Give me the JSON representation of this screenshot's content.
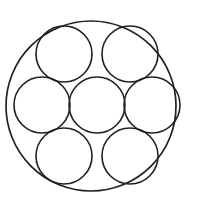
{
  "figure": {
    "name": "seven-circles-in-circle",
    "background_color": "#ffffff",
    "stroke_color": "#231f20",
    "stroke_width": 1.6,
    "fill": "none",
    "canvas": {
      "width": 202,
      "height": 201
    },
    "outer_circle": {
      "label": "outer-boundary-circle",
      "cx": 91,
      "cy": 106,
      "r": 85,
      "stroke_width": 1.7
    },
    "inner_radius": 28,
    "inner_circles": [
      {
        "label": "center-circle",
        "position": "center",
        "cx": 97,
        "cy": 105,
        "r": 28
      },
      {
        "label": "top-left-circle",
        "position": "top-left",
        "cx": 64,
        "cy": 54,
        "r": 28
      },
      {
        "label": "top-right-circle",
        "position": "top-right",
        "cx": 130,
        "cy": 54,
        "r": 28
      },
      {
        "label": "left-circle",
        "position": "left",
        "cx": 42,
        "cy": 105,
        "r": 28
      },
      {
        "label": "right-circle",
        "position": "right",
        "cx": 152,
        "cy": 105,
        "r": 28
      },
      {
        "label": "bottom-left-circle",
        "position": "bottom-left",
        "cx": 64,
        "cy": 156,
        "r": 28
      },
      {
        "label": "bottom-right-circle",
        "position": "bottom-right",
        "cx": 130,
        "cy": 156,
        "r": 28
      }
    ],
    "inner_circle_count": 7,
    "total_circle_count": 8
  }
}
